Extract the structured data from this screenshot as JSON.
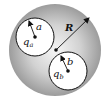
{
  "diagram": {
    "outer_sphere": {
      "label": "R",
      "fill_center": "#f6f6f6",
      "fill_edge": "#9a9a9a"
    },
    "cavity_a": {
      "radius_label": "a",
      "charge_label": "q",
      "charge_subscript": "a"
    },
    "cavity_b": {
      "radius_label": "b",
      "charge_label": "q",
      "charge_subscript": "b"
    },
    "colors": {
      "stroke": "#111111",
      "cavity_fill": "#ffffff",
      "background": "#ffffff"
    }
  }
}
